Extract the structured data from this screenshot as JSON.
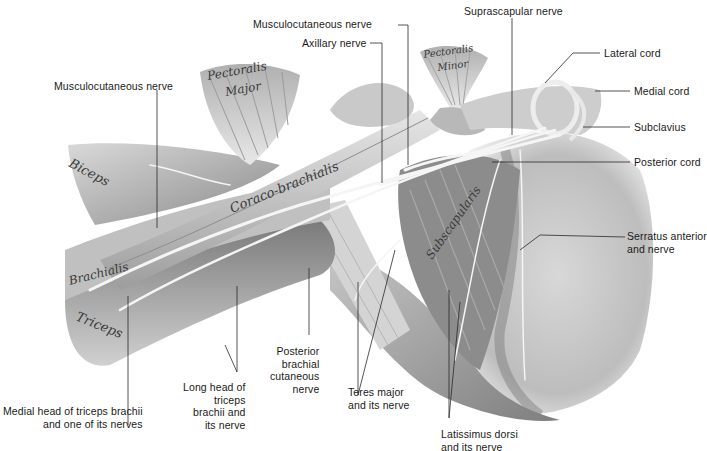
{
  "figure": {
    "type": "anatomical-illustration",
    "colors": {
      "background": "#ffffff",
      "ink": "#1a1a1a",
      "muscle_dark": "#6e6e6e",
      "muscle_mid": "#a8a8a8",
      "muscle_light": "#dcdcdc",
      "nerve": "#f4f4f4"
    }
  },
  "muscle_labels": {
    "pectoralis_major": [
      "Pectoralis",
      "Major"
    ],
    "pectoralis_minor": [
      "Pectoralis",
      "Minor"
    ],
    "biceps": "Biceps",
    "coracobrachialis": "Coraco-brachialis",
    "brachialis": "Brachialis",
    "triceps": "Triceps",
    "subscapularis": "Subscapularis"
  },
  "callouts": {
    "musculocutaneous_nerve_top": "Musculocutaneous nerve",
    "axillary_nerve": "Axillary nerve",
    "suprascapular_nerve": "Suprascapular nerve",
    "lateral_cord": "Lateral cord",
    "medial_cord": "Medial cord",
    "subclavius": "Subclavius",
    "posterior_cord": "Posterior cord",
    "serratus_anterior": [
      "Serratus anterior",
      "and nerve"
    ],
    "musculocutaneous_nerve_left": "Musculocutaneous nerve",
    "medial_head_triceps": [
      "Medial head of triceps brachii",
      "and one of its nerves"
    ],
    "long_head_triceps": [
      "Long head of",
      "triceps",
      "brachii and",
      "its nerve"
    ],
    "posterior_brachial_cutaneous": [
      "Posterior",
      "brachial",
      "cutaneous",
      "nerve"
    ],
    "teres_major": [
      "Teres major",
      "and its nerve"
    ],
    "latissimus_dorsi": [
      "Latissimus dorsi",
      "and its nerve"
    ]
  }
}
